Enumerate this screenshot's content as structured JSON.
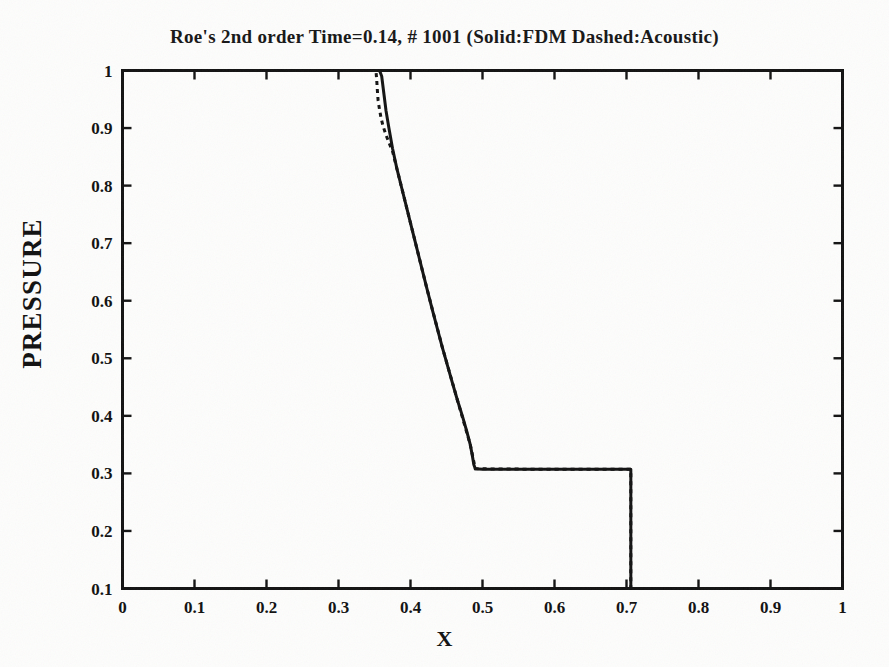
{
  "chart_data": {
    "type": "line",
    "title": "Roe's 2nd order Time=0.14, # 1001 (Solid:FDM Dashed:Acoustic)",
    "xlabel": "X",
    "ylabel": "PRESSURE",
    "xlim": [
      0,
      1
    ],
    "ylim": [
      0.1,
      1
    ],
    "grid": false,
    "legend_position": "in-title",
    "xticks": [
      "0",
      "0.1",
      "0.2",
      "0.3",
      "0.4",
      "0.5",
      "0.6",
      "0.7",
      "0.8",
      "0.9",
      "1"
    ],
    "xtick_values": [
      0,
      0.1,
      0.2,
      0.3,
      0.4,
      0.5,
      0.6,
      0.7,
      0.8,
      0.9,
      1
    ],
    "yticks": [
      "0.1",
      "0.2",
      "0.3",
      "0.4",
      "0.5",
      "0.6",
      "0.7",
      "0.8",
      "0.9",
      "1"
    ],
    "ytick_values": [
      0.1,
      0.2,
      0.3,
      0.4,
      0.5,
      0.6,
      0.7,
      0.8,
      0.9,
      1
    ],
    "annotations": [
      "Solid:FDM",
      "Dashed:Acoustic"
    ],
    "series": [
      {
        "name": "Solid:FDM",
        "style": "solid",
        "color": "#121212",
        "points": [
          [
            0.0,
            1.0
          ],
          [
            0.1,
            1.0
          ],
          [
            0.2,
            1.0
          ],
          [
            0.3,
            1.0
          ],
          [
            0.34,
            1.0
          ],
          [
            0.357,
            1.0
          ],
          [
            0.36,
            0.99
          ],
          [
            0.363,
            0.96
          ],
          [
            0.366,
            0.93
          ],
          [
            0.37,
            0.9
          ],
          [
            0.375,
            0.865
          ],
          [
            0.381,
            0.83
          ],
          [
            0.388,
            0.795
          ],
          [
            0.395,
            0.76
          ],
          [
            0.402,
            0.725
          ],
          [
            0.409,
            0.69
          ],
          [
            0.416,
            0.655
          ],
          [
            0.423,
            0.62
          ],
          [
            0.43,
            0.586
          ],
          [
            0.437,
            0.553
          ],
          [
            0.444,
            0.52
          ],
          [
            0.451,
            0.489
          ],
          [
            0.458,
            0.458
          ],
          [
            0.465,
            0.428
          ],
          [
            0.472,
            0.4
          ],
          [
            0.478,
            0.374
          ],
          [
            0.483,
            0.35
          ],
          [
            0.486,
            0.33
          ],
          [
            0.488,
            0.315
          ],
          [
            0.49,
            0.308
          ],
          [
            0.5,
            0.307
          ],
          [
            0.55,
            0.307
          ],
          [
            0.6,
            0.307
          ],
          [
            0.65,
            0.307
          ],
          [
            0.69,
            0.307
          ],
          [
            0.703,
            0.307
          ],
          [
            0.706,
            0.307
          ],
          [
            0.706,
            0.1
          ],
          [
            0.75,
            0.1
          ],
          [
            0.85,
            0.1
          ],
          [
            1.0,
            0.1
          ]
        ]
      },
      {
        "name": "Dashed:Acoustic",
        "style": "dashed",
        "color": "#121212",
        "points": [
          [
            0.0,
            1.0
          ],
          [
            0.2,
            1.0
          ],
          [
            0.34,
            1.0
          ],
          [
            0.352,
            1.0
          ],
          [
            0.353,
            0.985
          ],
          [
            0.354,
            0.965
          ],
          [
            0.355,
            0.948
          ],
          [
            0.357,
            0.932
          ],
          [
            0.359,
            0.918
          ],
          [
            0.362,
            0.903
          ],
          [
            0.366,
            0.888
          ],
          [
            0.37,
            0.875
          ],
          [
            0.375,
            0.86
          ],
          [
            0.381,
            0.83
          ],
          [
            0.388,
            0.795
          ],
          [
            0.395,
            0.76
          ],
          [
            0.409,
            0.69
          ],
          [
            0.423,
            0.62
          ],
          [
            0.444,
            0.52
          ],
          [
            0.465,
            0.428
          ],
          [
            0.483,
            0.35
          ],
          [
            0.49,
            0.308
          ],
          [
            0.6,
            0.307
          ],
          [
            0.706,
            0.307
          ],
          [
            0.706,
            0.1
          ],
          [
            1.0,
            0.1
          ]
        ]
      }
    ]
  }
}
